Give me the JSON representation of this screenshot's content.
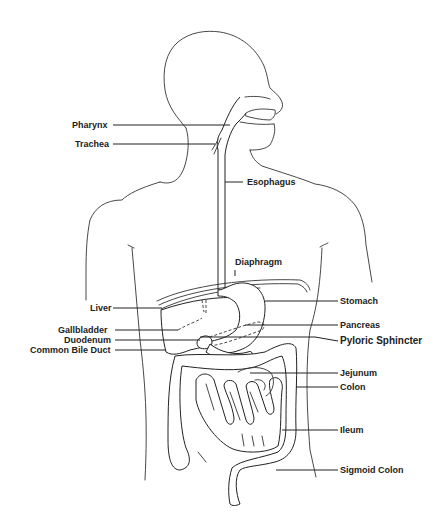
{
  "diagram": {
    "labels": {
      "pharynx": "Pharynx",
      "trachea": "Trachea",
      "esophagus": "Esophagus",
      "diaphragm": "Diaphragm",
      "liver": "Liver",
      "stomach": "Stomach",
      "gallbladder": "Gallbladder",
      "pancreas": "Pancreas",
      "duodenum": "Duodenum",
      "pyloric_sphincter": "Pyloric Sphincter",
      "common_bile_duct": "Common Bile Duct",
      "jejunum": "Jejunum",
      "colon": "Colon",
      "ileum": "Ileum",
      "sigmoid_colon": "Sigmoid Colon"
    },
    "colors": {
      "line": "#222222",
      "background": "#ffffff"
    }
  }
}
